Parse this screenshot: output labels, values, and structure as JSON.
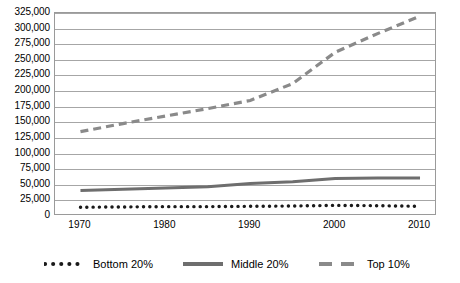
{
  "chart_data": {
    "type": "line",
    "title": "",
    "xlabel": "",
    "ylabel": "",
    "x": [
      1970,
      1980,
      1990,
      2000,
      2010
    ],
    "categories": [
      "1970",
      "1980",
      "1990",
      "2000",
      "2010"
    ],
    "xtick_labels": [
      "1970",
      "1980",
      "1990",
      "2000",
      "2010"
    ],
    "ytick_labels": [
      "325,000",
      "300,000",
      "275,000",
      "250,000",
      "225,000",
      "200,000",
      "175,000",
      "150,000",
      "125,000",
      "100,000",
      "75,000",
      "50,000",
      "25,000",
      "0"
    ],
    "ytick_values": [
      325000,
      300000,
      275000,
      250000,
      225000,
      200000,
      175000,
      150000,
      125000,
      100000,
      75000,
      50000,
      25000,
      0
    ],
    "ylim": [
      0,
      325000
    ],
    "xlim": [
      1967,
      2012
    ],
    "grid": "horizontal",
    "legend_position": "bottom",
    "series": [
      {
        "name": "Bottom 20%",
        "style": "dotted",
        "color": "#1a1a1a",
        "x": [
          1970,
          1975,
          1980,
          1985,
          1990,
          1995,
          2000,
          2005,
          2010
        ],
        "values": [
          14000,
          14500,
          15000,
          15000,
          15500,
          16000,
          17000,
          16500,
          15500
        ]
      },
      {
        "name": "Middle 20%",
        "style": "solid",
        "color": "#6e6e6e",
        "x": [
          1970,
          1975,
          1980,
          1985,
          1990,
          1995,
          2000,
          2005,
          2010
        ],
        "values": [
          41000,
          43000,
          45000,
          47000,
          52000,
          55000,
          60000,
          61000,
          61000
        ]
      },
      {
        "name": "Top 10%",
        "style": "dashed",
        "color": "#8a8a8a",
        "x": [
          1970,
          1975,
          1980,
          1985,
          1990,
          1995,
          2000,
          2005,
          2010
        ],
        "values": [
          135000,
          148000,
          160000,
          172000,
          185000,
          212000,
          262000,
          292000,
          320000
        ]
      }
    ]
  },
  "legend": {
    "items": [
      {
        "label": "Bottom 20%",
        "marker": "dotted-line-marker"
      },
      {
        "label": "Middle 20%",
        "marker": "solid-line-marker"
      },
      {
        "label": "Top 10%",
        "marker": "dashed-line-marker"
      }
    ]
  },
  "colors": {
    "grid": "#a6a6a6",
    "frame": "#9a9a9a",
    "background": "#ffffff",
    "bottom20": "#1a1a1a",
    "middle20": "#6e6e6e",
    "top10": "#8a8a8a"
  }
}
